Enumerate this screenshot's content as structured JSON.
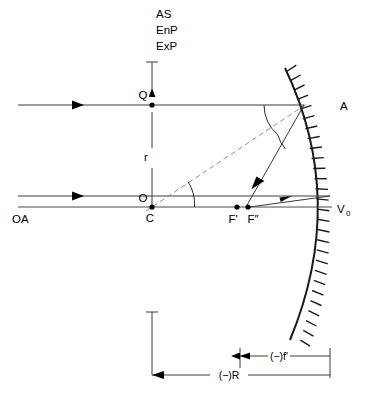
{
  "figure": {
    "background_color": "#ffffff",
    "line_color": "#3a3a3a",
    "mirror_color": "#1a1a1a",
    "normal_color": "#8a8a8a"
  },
  "stop_labels": {
    "aperture_stop": "AS",
    "entrance_pupil": "EnP",
    "exit_pupil": "ExP"
  },
  "points": {
    "q": "Q",
    "a": "A",
    "o": "O",
    "c": "C",
    "f_prime": "F'",
    "f_double_prime": "F″",
    "vertex": "V",
    "vertex_subscript": "0"
  },
  "axis_label": "OA",
  "radius_label": "r",
  "dimensions": {
    "focal_length": "(−)f'",
    "radius_of_curvature": "(−)R"
  }
}
